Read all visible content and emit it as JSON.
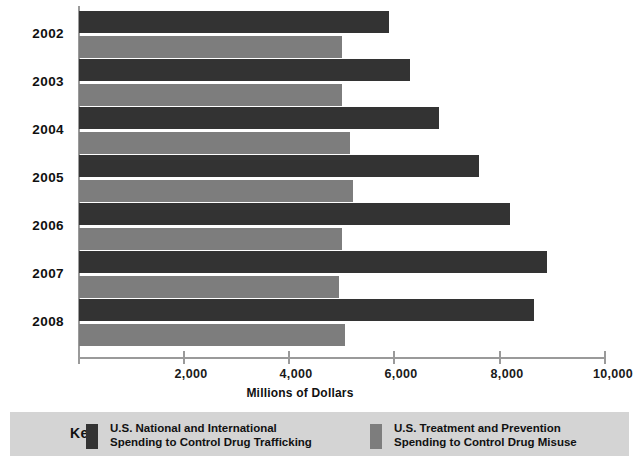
{
  "chart_data": {
    "type": "bar",
    "orientation": "horizontal",
    "title": "",
    "xlabel": "Millions of Dollars",
    "ylabel": "",
    "xlim": [
      0,
      10000
    ],
    "xticks": [
      "2,000",
      "4,000",
      "6,000",
      "8,000",
      "10,000"
    ],
    "xtick_values": [
      2000,
      4000,
      6000,
      8000,
      10000
    ],
    "grid": false,
    "categories": [
      "2002",
      "2003",
      "2004",
      "2005",
      "2006",
      "2007",
      "2008"
    ],
    "series": [
      {
        "name": "U.S. National and International Spending to Control Drug Trafficking",
        "color": "#333333",
        "values": [
          5900,
          6300,
          6850,
          7600,
          8200,
          8900,
          8650
        ]
      },
      {
        "name": "U.S. Treatment and Prevention Spending to Control Drug Misuse",
        "color": "#7d7d7d",
        "values": [
          5000,
          5000,
          5150,
          5200,
          5000,
          4950,
          5050
        ]
      }
    ],
    "legend_position": "bottom"
  },
  "legend": {
    "key_label": "Key",
    "background": "#d4d4d4",
    "entries": [
      {
        "swatch": "dark",
        "line1": "U.S. National and International",
        "line2": "Spending to Control Drug Trafficking"
      },
      {
        "swatch": "gray",
        "line1": "U.S. Treatment and Prevention",
        "line2": "Spending to Control Drug Misuse"
      }
    ]
  }
}
